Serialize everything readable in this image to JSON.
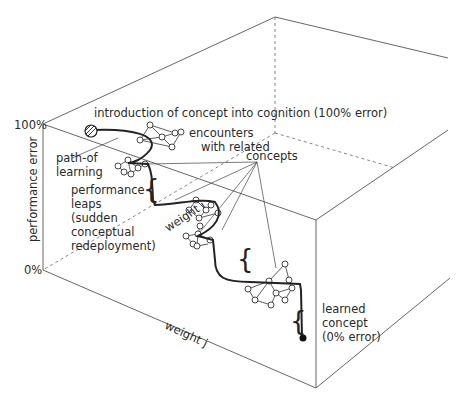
{
  "diagram": {
    "axes": {
      "y_label": "performance error",
      "y_top": "100%",
      "y_bottom": "0%",
      "weight_i": "weight i",
      "weight_j": "weight j"
    },
    "labels": {
      "intro": "introduction of concept into cognition (100% error)",
      "encounters_1": "encounters",
      "encounters_2": "with related",
      "encounters_3": "concepts",
      "path_1": "path-of",
      "path_2": "learning",
      "leaps_1": "performance",
      "leaps_2": "leaps",
      "leaps_3": "(sudden",
      "leaps_4": "conceptual",
      "leaps_5": "redeployment)",
      "learned_1": "learned",
      "learned_2": "concept",
      "learned_3": "(0% error)"
    },
    "colors": {
      "line": "#222222",
      "box_edge": "#555555",
      "background": "#ffffff"
    }
  }
}
